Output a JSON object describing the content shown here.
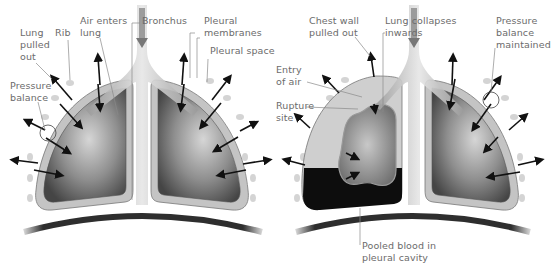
{
  "diagram": {
    "left_panel": {
      "name": "normal-lung",
      "labels": {
        "lung_pulled_out": "Lung\npulled\nout",
        "rib": "Rib",
        "air_enters_lung": "Air enters\nlung",
        "bronchus": "Bronchus",
        "pleural_membranes": "Pleural\nmembranes",
        "pleural_space": "Pleural space",
        "pressure_balance": "Pressure\nbalance"
      }
    },
    "right_panel": {
      "name": "haemothorax-lung",
      "labels": {
        "chest_wall_pulled_out": "Chest wall\npulled out",
        "lung_collapses_inwards": "Lung collapses\ninwards",
        "pressure_balance_maintained": "Pressure\nbalance\nmaintained",
        "entry_of_air": "Entry\nof air",
        "rupture_site": "Rupture\nsite",
        "pooled_blood": "Pooled blood in\npleural cavity"
      }
    },
    "colors": {
      "label_text": "#6b6b6b",
      "leader_line": "#8a8a8a",
      "lung_dark": "#4a4a4a",
      "lung_light": "#cfcfcf",
      "pleura": "#bdbdbd",
      "pleural_space": "#d9d9d9",
      "blood": "#0d0d0d",
      "diaphragm": "#2e2e2e",
      "arrow": "#111111",
      "rib": "#d4d4d4"
    }
  }
}
